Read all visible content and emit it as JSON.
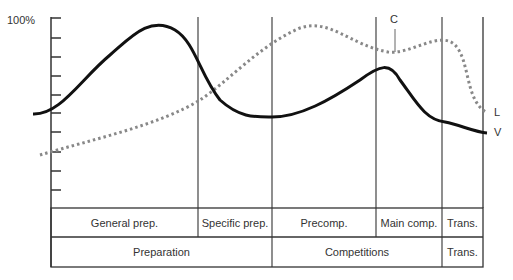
{
  "y_axis": {
    "top_label": "100%",
    "tick_count": 10
  },
  "curves": [
    {
      "id": "V",
      "label": "V",
      "style": "solid"
    },
    {
      "id": "L",
      "label": "L",
      "style": "dotted"
    },
    {
      "id": "C",
      "label": "C",
      "style": "callout"
    }
  ],
  "table": {
    "row1": [
      "General prep.",
      "Specific prep.",
      "Precomp.",
      "Main comp.",
      "Trans."
    ],
    "row2": [
      "Preparation",
      "Competitions",
      "Trans."
    ]
  }
}
